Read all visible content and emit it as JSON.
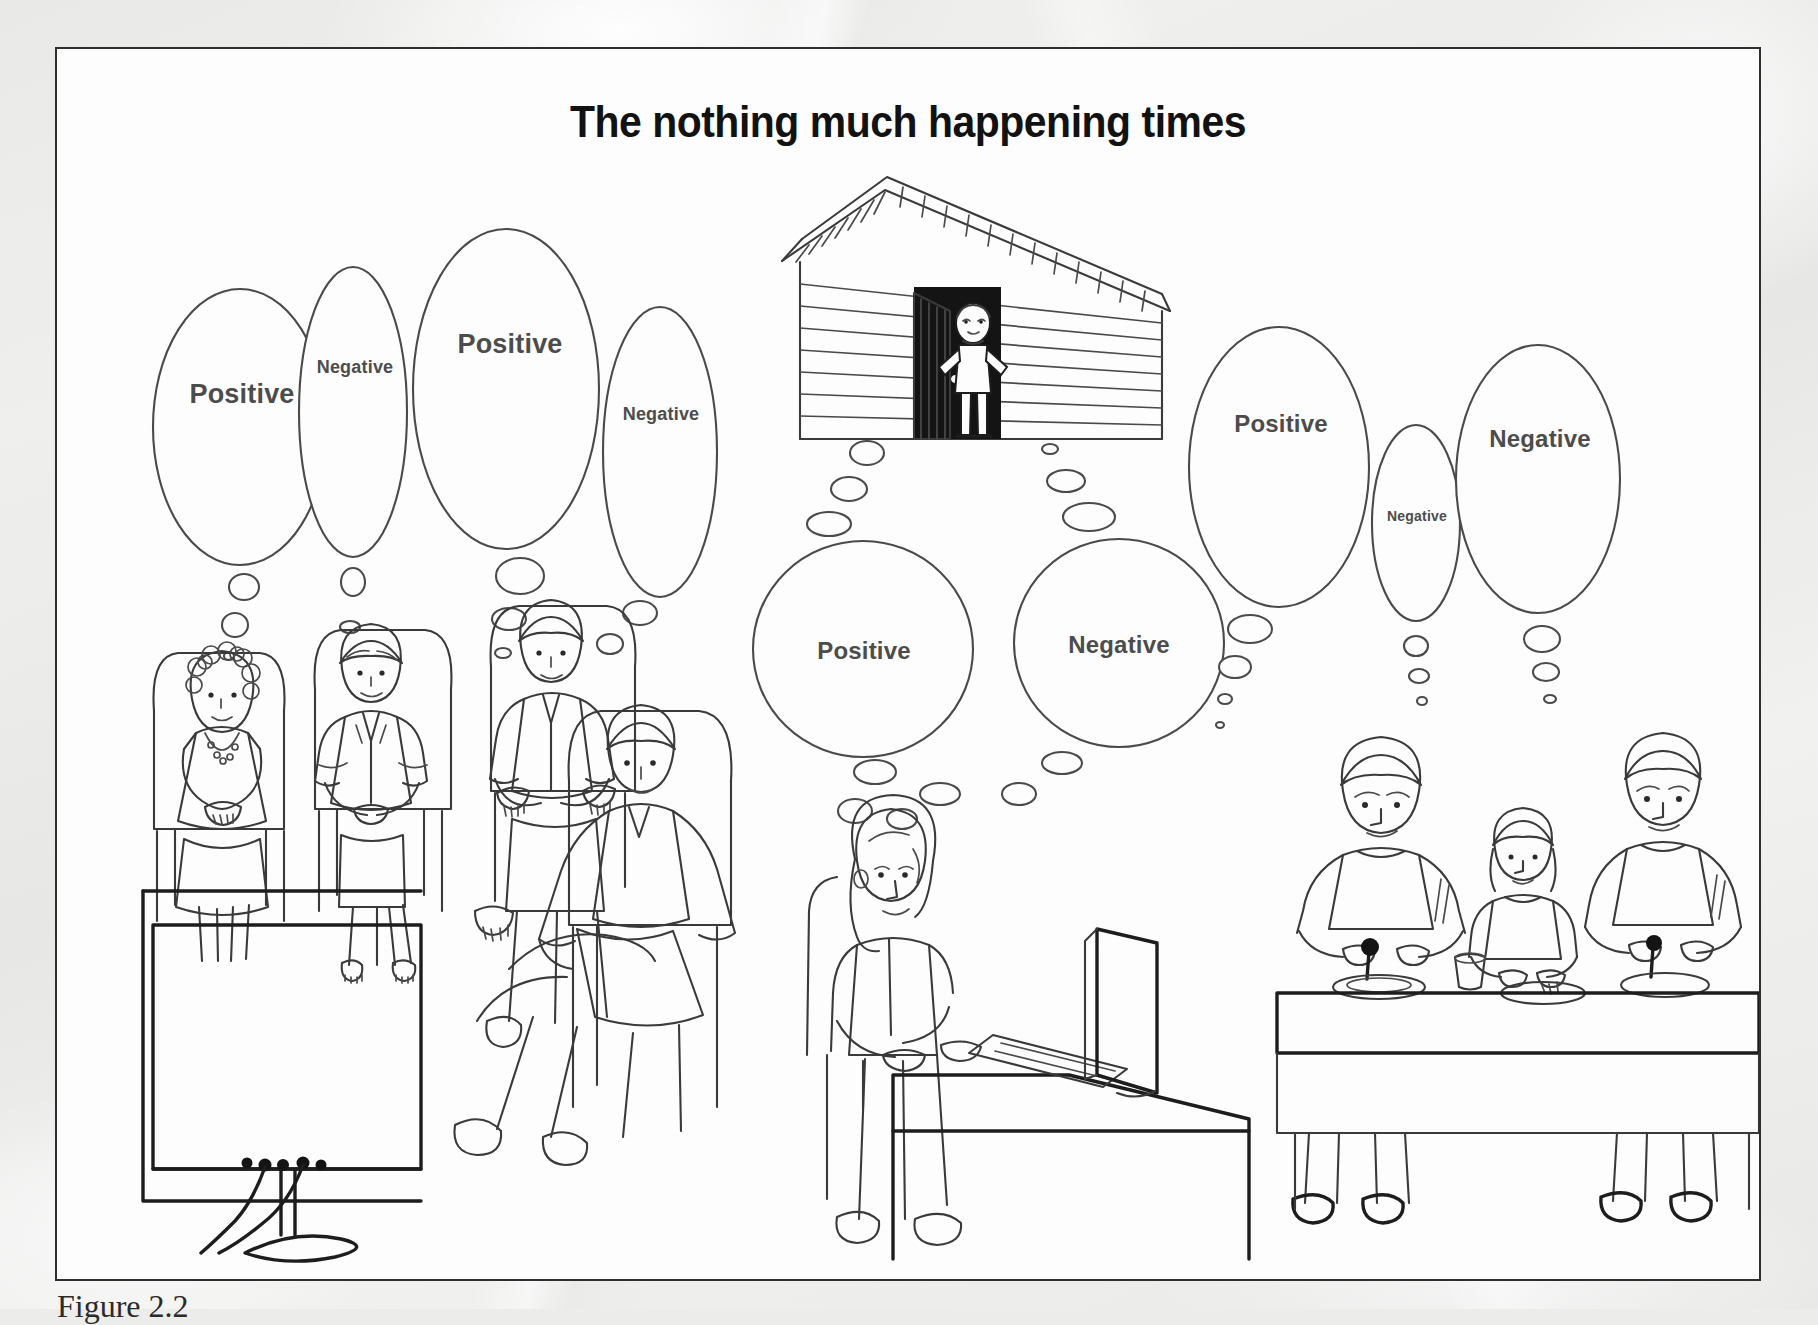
{
  "figure": {
    "title": "The nothing much happening times",
    "caption": "Figure 2.2",
    "border_color": "#2f2f2f",
    "page_background": "#ececeb",
    "ink_color": "#3a3a3a",
    "label_color": "#4c4c4c"
  },
  "thought_bubbles": [
    {
      "label": "Positive",
      "size": "lg",
      "group": "tv-viewers",
      "person": 1
    },
    {
      "label": "Negative",
      "size": "sm",
      "group": "tv-viewers",
      "person": 1
    },
    {
      "label": "Positive",
      "size": "lg",
      "group": "tv-viewers",
      "person": 2
    },
    {
      "label": "Negative",
      "size": "sm",
      "group": "tv-viewers",
      "person": 3
    },
    {
      "label": "Positive",
      "size": "md",
      "group": "computer-user",
      "person": 1
    },
    {
      "label": "Negative",
      "size": "md",
      "group": "computer-user",
      "person": 1
    },
    {
      "label": "Positive",
      "size": "lg",
      "group": "dining-family",
      "person": 1
    },
    {
      "label": "Negative",
      "size": "xs",
      "group": "dining-family",
      "person": 2
    },
    {
      "label": "Negative",
      "size": "md",
      "group": "dining-family",
      "person": 3
    }
  ],
  "scenes": [
    {
      "name": "tv-viewers",
      "description": "Four people seated in chairs watching a large television"
    },
    {
      "name": "shed-doorway",
      "description": "Person standing in the open doorway of a wooden shed"
    },
    {
      "name": "computer-user",
      "description": "Person sitting at a desk typing on a computer keyboard"
    },
    {
      "name": "dining-family",
      "description": "Three people seated at a dining table eating a meal"
    }
  ]
}
